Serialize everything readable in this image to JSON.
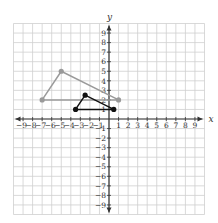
{
  "chart_data": {
    "type": "scatter",
    "title": "",
    "xlabel": "x",
    "ylabel": "y",
    "xlim": [
      -10,
      10
    ],
    "ylim": [
      -10,
      10
    ],
    "grid": true,
    "x_ticks": [
      -9,
      -8,
      -7,
      -6,
      -5,
      -4,
      -3,
      -2,
      -1,
      1,
      2,
      3,
      4,
      5,
      6,
      7,
      8,
      9
    ],
    "y_ticks": [
      -9,
      -8,
      -7,
      -6,
      -5,
      -4,
      -3,
      -2,
      -1,
      1,
      2,
      3,
      4,
      5,
      6,
      7,
      8,
      9
    ],
    "series": [
      {
        "name": "gray-triangle",
        "shape": "triangle",
        "color": "#9a9a9a",
        "points": [
          [
            -7,
            2
          ],
          [
            -5,
            5
          ],
          [
            1,
            2
          ]
        ]
      },
      {
        "name": "black-triangle",
        "shape": "triangle",
        "color": "#111111",
        "points": [
          [
            -3.5,
            1
          ],
          [
            -2.5,
            2.5
          ],
          [
            0.5,
            1
          ]
        ]
      }
    ]
  },
  "layout": {
    "origin_px": [
      109,
      119
    ],
    "unit_px": 9.55,
    "grid_color": "#cfcfcf",
    "axis_color": "#333333"
  }
}
